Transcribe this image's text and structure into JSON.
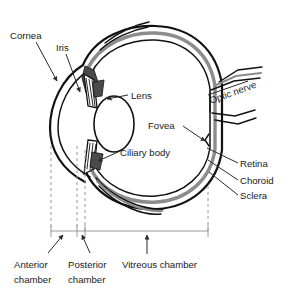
{
  "figure": {
    "background_color": "#ffffff"
  },
  "colors": {
    "outline_black": "#111111",
    "choroid_gray": "#8c8c8c",
    "ciliary_dark": "#4a4a4a",
    "leader_line": "#2b2b2b",
    "dashed_guide": "#9a9a9a",
    "scale_bar": "#9a9a9a",
    "text": "#1a1a1a"
  },
  "labels": {
    "cornea": "Cornea",
    "iris": "Iris",
    "lens": "Lens",
    "optic_nerve": "Optic nerve",
    "fovea": "Fovea",
    "ciliary_body": "Ciliary body",
    "retina": "Retina",
    "choroid": "Choroid",
    "sclera": "Sclera"
  },
  "chambers": [
    {
      "id": "anterior-chamber",
      "line1": "Anterior",
      "line2": "chamber"
    },
    {
      "id": "posterior-chamber",
      "line1": "Posterior",
      "line2": "chamber"
    },
    {
      "id": "vitreous-chamber",
      "line1": "Vitreous chamber",
      "line2": ""
    }
  ]
}
